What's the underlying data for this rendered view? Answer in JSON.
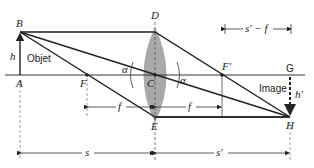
{
  "diagram": {
    "type": "thin-lens ray diagram (converging lens, real inverted image)",
    "points": {
      "A": {
        "label": "A",
        "x": 20,
        "y": 75
      },
      "B": {
        "label": "B",
        "x": 20,
        "y": 32
      },
      "C": {
        "label": "C",
        "x": 155,
        "y": 75
      },
      "D": {
        "label": "D",
        "x": 155,
        "y": 32
      },
      "E": {
        "label": "E",
        "x": 155,
        "y": 117
      },
      "F": {
        "label": "F",
        "x": 87,
        "y": 75
      },
      "F_prime": {
        "label": "F′",
        "x": 222,
        "y": 75
      },
      "G": {
        "label": "G",
        "x": 290,
        "y": 75
      },
      "H": {
        "label": "H",
        "x": 290,
        "y": 117
      }
    },
    "labels": {
      "object": "Objet",
      "image": "Image",
      "h": "h",
      "h_prime": "h′",
      "alpha": "α",
      "f": "f",
      "s": "s",
      "s_prime": "s′",
      "s_prime_minus_f": "s′ − f"
    },
    "colors": {
      "lens": "#9a9a9a",
      "line": "#222222",
      "dashed": "#888888"
    }
  }
}
